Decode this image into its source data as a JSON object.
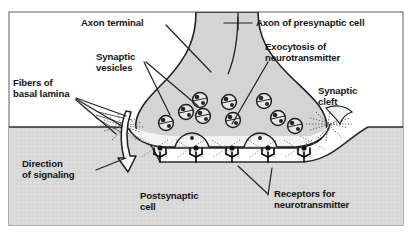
{
  "figure": {
    "border_color": "#9a9a9a",
    "background_color": "#ffffff",
    "cell_fill": "#d9d9d9",
    "terminal_fill": "#d4d4d4",
    "cleft_fill": "#f2f2f2",
    "ink_color": "#141414"
  },
  "labels": {
    "axon_terminal": "Axon terminal",
    "axon_presynaptic": "Axon of presynaptic cell",
    "synaptic_vesicles_line1": "Synaptic",
    "synaptic_vesicles_line2": "vesicles",
    "exocytosis_line1": "Exocytosis of",
    "exocytosis_line2": "neurotransmitter",
    "fibers_line1": "Fibers of",
    "fibers_line2": "basal lamina",
    "synaptic_cleft_line1": "Synaptic",
    "synaptic_cleft_line2": "cleft",
    "direction_line1": "Direction",
    "direction_line2": "of signaling",
    "postsynaptic_line1": "Postsynaptic",
    "postsynaptic_line2": "cell",
    "receptors_line1": "Receptors for",
    "receptors_line2": "neurotransmitter"
  },
  "structures": {
    "vesicle_count": 9,
    "receptor_count": 5,
    "fusing_vesicle_count": 2,
    "vesicle_name": "synaptic-vesicle",
    "receptor_name": "neurotransmitter-receptor"
  }
}
